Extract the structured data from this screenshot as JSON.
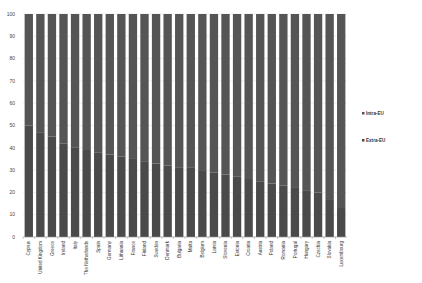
{
  "chart_data": {
    "type": "bar",
    "stacked": true,
    "title": "",
    "xlabel": "",
    "ylabel": "",
    "ylim": [
      0,
      100
    ],
    "yticks": [
      0,
      10,
      20,
      30,
      40,
      50,
      60,
      70,
      80,
      90,
      100
    ],
    "grid": true,
    "legend_position": "right",
    "categories": [
      "Cyprus",
      "United Kingdom",
      "Greece",
      "Ireland",
      "Italy",
      "The Netherlands",
      "Spain",
      "Germany",
      "Lithuania",
      "France",
      "Finland",
      "Sweden",
      "Denmark",
      "Bulgaria",
      "Malta",
      "Belgium",
      "Latvia",
      "Slovenia",
      "Estonia",
      "Croatia",
      "Austria",
      "Poland",
      "Romania",
      "Portugal",
      "Hungary",
      "Czechia",
      "Slovakia",
      "Luxembourg"
    ],
    "series": [
      {
        "name": "Extra-EU",
        "color": "#4a4a4a",
        "values": [
          50,
          47,
          45,
          42,
          40,
          39,
          38,
          37,
          36,
          35,
          34,
          33,
          32,
          31,
          31,
          30,
          29,
          28,
          27,
          26,
          25,
          24,
          23,
          22,
          21,
          20,
          17,
          13
        ]
      },
      {
        "name": "Intra-EU",
        "color": "#555555",
        "values": [
          50,
          53,
          55,
          58,
          60,
          61,
          62,
          63,
          64,
          65,
          66,
          67,
          68,
          69,
          69,
          70,
          71,
          72,
          73,
          74,
          75,
          76,
          77,
          78,
          79,
          80,
          83,
          87
        ]
      }
    ]
  },
  "legend": {
    "items": [
      {
        "label": "Intra-EU",
        "color": "#555555"
      },
      {
        "label": "Extra-EU",
        "color": "#4a4a4a"
      }
    ]
  }
}
